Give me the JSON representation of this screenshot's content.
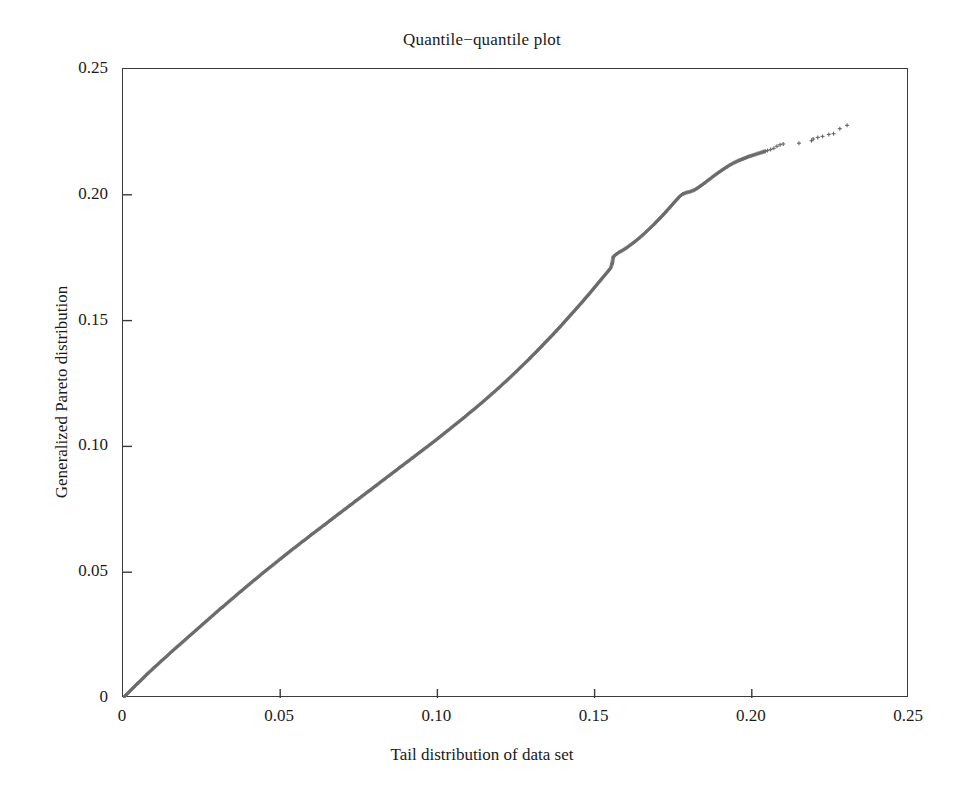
{
  "chart_data": {
    "type": "scatter",
    "title": "Quantile−quantile plot",
    "xlabel": "Tail distribution of data set",
    "ylabel": "Generalized Pareto distribution",
    "xlim": [
      0,
      0.25
    ],
    "ylim": [
      0,
      0.25
    ],
    "xticks": [
      0,
      0.05,
      0.1,
      0.15,
      0.2,
      0.25
    ],
    "xtick_labels": [
      "0",
      "0.05",
      "0.10",
      "0.15",
      "0.20",
      "0.25"
    ],
    "yticks": [
      0,
      0.05,
      0.1,
      0.15,
      0.2,
      0.25
    ],
    "ytick_labels": [
      "0",
      "0.05",
      "0.10",
      "0.15",
      "0.20",
      "0.25"
    ],
    "grid": false,
    "legend": null,
    "marker": "plus",
    "marker_color": "#6b6b6b",
    "series_name": "quantile pairs",
    "points": [
      [
        0.0,
        0.0
      ],
      [
        0.0008,
        0.001
      ],
      [
        0.0016,
        0.002
      ],
      [
        0.0024,
        0.003
      ],
      [
        0.0032,
        0.004
      ],
      [
        0.004,
        0.005
      ],
      [
        0.0048,
        0.006
      ],
      [
        0.0056,
        0.0069
      ],
      [
        0.0064,
        0.0079
      ],
      [
        0.0072,
        0.0089
      ],
      [
        0.008,
        0.0099
      ],
      [
        0.009,
        0.011
      ],
      [
        0.01,
        0.0122
      ],
      [
        0.011,
        0.0133
      ],
      [
        0.012,
        0.0145
      ],
      [
        0.013,
        0.0156
      ],
      [
        0.014,
        0.0167
      ],
      [
        0.015,
        0.0179
      ],
      [
        0.016,
        0.019
      ],
      [
        0.017,
        0.0201
      ],
      [
        0.018,
        0.0212
      ],
      [
        0.019,
        0.0223
      ],
      [
        0.02,
        0.0234
      ],
      [
        0.021,
        0.0245
      ],
      [
        0.022,
        0.0256
      ],
      [
        0.023,
        0.0267
      ],
      [
        0.024,
        0.0278
      ],
      [
        0.025,
        0.0289
      ],
      [
        0.026,
        0.03
      ],
      [
        0.027,
        0.0311
      ],
      [
        0.028,
        0.0322
      ],
      [
        0.029,
        0.0333
      ],
      [
        0.03,
        0.0344
      ],
      [
        0.031,
        0.0355
      ],
      [
        0.032,
        0.0365
      ],
      [
        0.033,
        0.0376
      ],
      [
        0.034,
        0.0387
      ],
      [
        0.035,
        0.0397
      ],
      [
        0.036,
        0.0408
      ],
      [
        0.037,
        0.0419
      ],
      [
        0.038,
        0.0429
      ],
      [
        0.039,
        0.044
      ],
      [
        0.04,
        0.045
      ],
      [
        0.041,
        0.0461
      ],
      [
        0.042,
        0.0471
      ],
      [
        0.043,
        0.0481
      ],
      [
        0.044,
        0.0492
      ],
      [
        0.045,
        0.0502
      ],
      [
        0.046,
        0.0512
      ],
      [
        0.047,
        0.0522
      ],
      [
        0.048,
        0.0532
      ],
      [
        0.049,
        0.0542
      ],
      [
        0.05,
        0.0552
      ],
      [
        0.051,
        0.0562
      ],
      [
        0.052,
        0.0572
      ],
      [
        0.053,
        0.0582
      ],
      [
        0.054,
        0.0592
      ],
      [
        0.055,
        0.0601
      ],
      [
        0.056,
        0.0611
      ],
      [
        0.057,
        0.0621
      ],
      [
        0.058,
        0.063
      ],
      [
        0.059,
        0.064
      ],
      [
        0.06,
        0.065
      ],
      [
        0.061,
        0.0659
      ],
      [
        0.062,
        0.0669
      ],
      [
        0.063,
        0.0678
      ],
      [
        0.064,
        0.0688
      ],
      [
        0.065,
        0.0697
      ],
      [
        0.066,
        0.0707
      ],
      [
        0.067,
        0.0716
      ],
      [
        0.068,
        0.0726
      ],
      [
        0.069,
        0.0735
      ],
      [
        0.07,
        0.0745
      ],
      [
        0.071,
        0.0754
      ],
      [
        0.072,
        0.0764
      ],
      [
        0.073,
        0.0773
      ],
      [
        0.074,
        0.0783
      ],
      [
        0.075,
        0.0792
      ],
      [
        0.076,
        0.0802
      ],
      [
        0.077,
        0.0811
      ],
      [
        0.078,
        0.0821
      ],
      [
        0.079,
        0.083
      ],
      [
        0.08,
        0.084
      ],
      [
        0.081,
        0.0849
      ],
      [
        0.082,
        0.0859
      ],
      [
        0.083,
        0.0868
      ],
      [
        0.084,
        0.0878
      ],
      [
        0.085,
        0.0887
      ],
      [
        0.086,
        0.0897
      ],
      [
        0.087,
        0.0906
      ],
      [
        0.088,
        0.0916
      ],
      [
        0.089,
        0.0925
      ],
      [
        0.09,
        0.0935
      ],
      [
        0.091,
        0.0944
      ],
      [
        0.092,
        0.0954
      ],
      [
        0.093,
        0.0963
      ],
      [
        0.094,
        0.0973
      ],
      [
        0.095,
        0.0982
      ],
      [
        0.096,
        0.0992
      ],
      [
        0.097,
        0.1001
      ],
      [
        0.098,
        0.1011
      ],
      [
        0.099,
        0.102
      ],
      [
        0.1,
        0.103
      ],
      [
        0.101,
        0.104
      ],
      [
        0.102,
        0.105
      ],
      [
        0.103,
        0.106
      ],
      [
        0.104,
        0.107
      ],
      [
        0.105,
        0.108
      ],
      [
        0.106,
        0.109
      ],
      [
        0.107,
        0.11
      ],
      [
        0.108,
        0.111
      ],
      [
        0.109,
        0.112
      ],
      [
        0.11,
        0.1131
      ],
      [
        0.111,
        0.1141
      ],
      [
        0.112,
        0.1151
      ],
      [
        0.113,
        0.1162
      ],
      [
        0.114,
        0.1172
      ],
      [
        0.115,
        0.1183
      ],
      [
        0.116,
        0.1194
      ],
      [
        0.117,
        0.1205
      ],
      [
        0.118,
        0.1216
      ],
      [
        0.119,
        0.1227
      ],
      [
        0.12,
        0.1238
      ],
      [
        0.121,
        0.125
      ],
      [
        0.122,
        0.1261
      ],
      [
        0.123,
        0.1273
      ],
      [
        0.124,
        0.1285
      ],
      [
        0.125,
        0.1297
      ],
      [
        0.126,
        0.1309
      ],
      [
        0.127,
        0.1321
      ],
      [
        0.128,
        0.1333
      ],
      [
        0.129,
        0.1345
      ],
      [
        0.13,
        0.1358
      ],
      [
        0.131,
        0.137
      ],
      [
        0.132,
        0.1383
      ],
      [
        0.133,
        0.1396
      ],
      [
        0.134,
        0.1409
      ],
      [
        0.135,
        0.1422
      ],
      [
        0.136,
        0.1435
      ],
      [
        0.137,
        0.1448
      ],
      [
        0.138,
        0.1462
      ],
      [
        0.139,
        0.1475
      ],
      [
        0.14,
        0.1489
      ],
      [
        0.141,
        0.1503
      ],
      [
        0.142,
        0.1517
      ],
      [
        0.143,
        0.1531
      ],
      [
        0.144,
        0.1545
      ],
      [
        0.145,
        0.1559
      ],
      [
        0.146,
        0.1573
      ],
      [
        0.147,
        0.1588
      ],
      [
        0.148,
        0.1602
      ],
      [
        0.149,
        0.1617
      ],
      [
        0.15,
        0.1632
      ],
      [
        0.151,
        0.1647
      ],
      [
        0.152,
        0.1662
      ],
      [
        0.153,
        0.1677
      ],
      [
        0.154,
        0.1692
      ],
      [
        0.155,
        0.1707
      ],
      [
        0.1555,
        0.1722
      ],
      [
        0.156,
        0.1755
      ],
      [
        0.157,
        0.1765
      ],
      [
        0.158,
        0.1773
      ],
      [
        0.159,
        0.178
      ],
      [
        0.16,
        0.1788
      ],
      [
        0.161,
        0.1797
      ],
      [
        0.162,
        0.1806
      ],
      [
        0.163,
        0.1816
      ],
      [
        0.164,
        0.1826
      ],
      [
        0.165,
        0.1837
      ],
      [
        0.166,
        0.1848
      ],
      [
        0.167,
        0.186
      ],
      [
        0.168,
        0.1872
      ],
      [
        0.169,
        0.1884
      ],
      [
        0.17,
        0.1897
      ],
      [
        0.171,
        0.191
      ],
      [
        0.172,
        0.1923
      ],
      [
        0.173,
        0.1937
      ],
      [
        0.174,
        0.1951
      ],
      [
        0.175,
        0.1965
      ],
      [
        0.176,
        0.1979
      ],
      [
        0.177,
        0.1993
      ],
      [
        0.178,
        0.2003
      ],
      [
        0.179,
        0.2008
      ],
      [
        0.18,
        0.2011
      ],
      [
        0.181,
        0.2015
      ],
      [
        0.182,
        0.2021
      ],
      [
        0.183,
        0.2029
      ],
      [
        0.184,
        0.2038
      ],
      [
        0.185,
        0.2047
      ],
      [
        0.186,
        0.2057
      ],
      [
        0.187,
        0.2066
      ],
      [
        0.188,
        0.2076
      ],
      [
        0.189,
        0.2085
      ],
      [
        0.19,
        0.2094
      ],
      [
        0.191,
        0.2102
      ],
      [
        0.192,
        0.211
      ],
      [
        0.193,
        0.2118
      ],
      [
        0.194,
        0.2125
      ],
      [
        0.195,
        0.2131
      ],
      [
        0.196,
        0.2137
      ],
      [
        0.197,
        0.2142
      ],
      [
        0.198,
        0.2147
      ],
      [
        0.199,
        0.2152
      ],
      [
        0.2,
        0.2156
      ],
      [
        0.201,
        0.216
      ],
      [
        0.202,
        0.2164
      ],
      [
        0.203,
        0.2168
      ],
      [
        0.204,
        0.2172
      ],
      [
        0.205,
        0.2176
      ],
      [
        0.206,
        0.218
      ],
      [
        0.207,
        0.2185
      ],
      [
        0.208,
        0.2193
      ],
      [
        0.209,
        0.2199
      ],
      [
        0.21,
        0.2202
      ],
      [
        0.215,
        0.2205
      ],
      [
        0.219,
        0.2215
      ],
      [
        0.2195,
        0.2222
      ],
      [
        0.221,
        0.2228
      ],
      [
        0.2225,
        0.2232
      ],
      [
        0.2245,
        0.224
      ],
      [
        0.226,
        0.2243
      ],
      [
        0.228,
        0.2263
      ],
      [
        0.2303,
        0.2276
      ]
    ]
  }
}
